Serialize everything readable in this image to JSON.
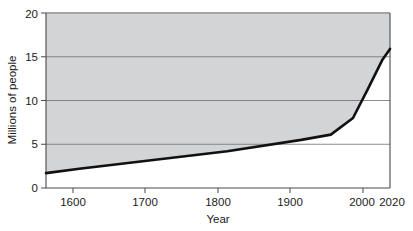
{
  "chart_data": {
    "type": "area",
    "title": "",
    "subtitle": "",
    "xlabel": "Year",
    "ylabel": "Millions of people",
    "xlim": [
      1555,
      2020
    ],
    "ylim": [
      0,
      20
    ],
    "xticks": [
      1600,
      1700,
      1800,
      1900,
      2000,
      2020
    ],
    "xtick_labels": [
      "1600",
      "1700",
      "1800",
      "1900",
      "2000",
      "2020"
    ],
    "yticks": [
      0,
      5,
      10,
      15,
      20
    ],
    "ytick_labels": [
      "0",
      "5",
      "10",
      "15",
      "20"
    ],
    "gridlines_y": [
      5,
      10,
      15
    ],
    "grid": true,
    "legend": null,
    "legend_position": "none",
    "fill_region": "above-line",
    "series": [
      {
        "name": "Population",
        "x": [
          1555,
          1600,
          1700,
          1800,
          1900,
          1940,
          1970,
          1990,
          2010,
          2020
        ],
        "values": [
          1.7,
          2.2,
          3.2,
          4.2,
          5.5,
          6.1,
          8.0,
          11.3,
          14.7,
          15.9
        ]
      }
    ],
    "annotations": []
  },
  "axis": {
    "y_title": "Millions of people",
    "x_title": "Year"
  },
  "colors": {
    "fill": "#d3d4d6",
    "line": "#111111",
    "grid": "#6e6e6e",
    "frame": "#4a4a4a",
    "text": "#1b1b1b",
    "background": "#ffffff"
  }
}
